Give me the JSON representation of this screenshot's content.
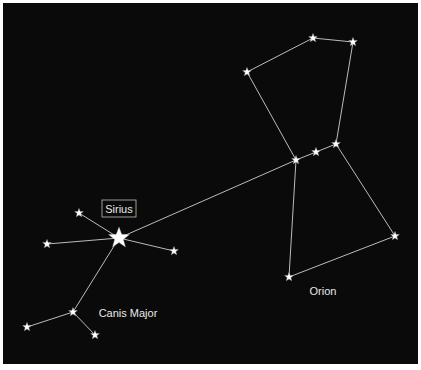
{
  "diagram": {
    "title": "",
    "background": "#0a0a0a",
    "line_color": "#cfcfcf",
    "star_color": "#ffffff",
    "labels": {
      "sirius": "Sirius",
      "canis_major": "Canis Major",
      "orion": "Orion"
    }
  },
  "chart_data": {
    "type": "scatter",
    "title": "",
    "constellations": [
      {
        "name": "Canis Major",
        "stars": [
          {
            "id": "sirius",
            "name": "Sirius",
            "x": 119,
            "y": 238,
            "size": "large"
          },
          {
            "id": "cma1",
            "x": 79,
            "y": 213
          },
          {
            "id": "cma2",
            "x": 47,
            "y": 244
          },
          {
            "id": "cma3",
            "x": 174,
            "y": 251
          },
          {
            "id": "cma4",
            "x": 73,
            "y": 312
          },
          {
            "id": "cma5",
            "x": 27,
            "y": 327
          },
          {
            "id": "cma6",
            "x": 95,
            "y": 335
          }
        ],
        "lines": [
          [
            "sirius",
            "cma1"
          ],
          [
            "sirius",
            "cma2"
          ],
          [
            "sirius",
            "cma3"
          ],
          [
            "sirius",
            "cma4"
          ],
          [
            "cma4",
            "cma5"
          ],
          [
            "cma4",
            "cma6"
          ]
        ]
      },
      {
        "name": "Orion",
        "stars": [
          {
            "id": "ori1",
            "x": 313,
            "y": 38
          },
          {
            "id": "ori2",
            "x": 353,
            "y": 42
          },
          {
            "id": "ori3",
            "x": 247,
            "y": 72
          },
          {
            "id": "ori4",
            "x": 296,
            "y": 160
          },
          {
            "id": "ori5",
            "x": 316,
            "y": 152
          },
          {
            "id": "ori6",
            "x": 336,
            "y": 144
          },
          {
            "id": "ori7",
            "x": 395,
            "y": 236
          },
          {
            "id": "ori8",
            "x": 289,
            "y": 277
          }
        ],
        "lines": [
          [
            "ori3",
            "ori1"
          ],
          [
            "ori1",
            "ori2"
          ],
          [
            "ori2",
            "ori6"
          ],
          [
            "ori3",
            "ori4"
          ],
          [
            "ori4",
            "ori5"
          ],
          [
            "ori5",
            "ori6"
          ],
          [
            "ori6",
            "ori7"
          ],
          [
            "ori7",
            "ori8"
          ],
          [
            "ori8",
            "ori4"
          ]
        ]
      }
    ],
    "connectors": [
      [
        "ori4",
        "sirius"
      ]
    ],
    "annotations": [
      {
        "text": "Sirius",
        "x": 119,
        "y": 209,
        "boxed": true
      },
      {
        "text": "Canis Major",
        "x": 128,
        "y": 316
      },
      {
        "text": "Orion",
        "x": 323,
        "y": 294
      }
    ]
  }
}
